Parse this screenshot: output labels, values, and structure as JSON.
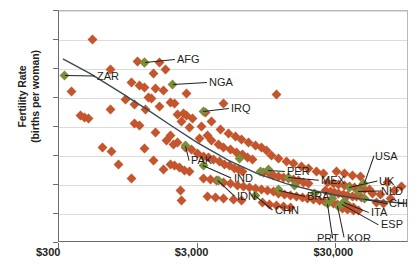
{
  "chart_data": {
    "type": "scatter",
    "title": "",
    "xlabel": "",
    "ylabel": "Fertility Rate (births per woman)",
    "ylabel_line1": "Fertility Rate",
    "ylabel_line2": "(births per woman)",
    "x_scale": "log",
    "xlim": [
      300,
      100000
    ],
    "ylim": [
      0,
      8
    ],
    "yticks": [
      0,
      1,
      2,
      3,
      4,
      5,
      6,
      7,
      8
    ],
    "ytick_labels": [
      "0",
      "1",
      "2",
      "3",
      "4",
      "5",
      "6",
      "7",
      "8"
    ],
    "xticks": [
      300,
      3000,
      30000
    ],
    "xtick_labels": [
      "$300",
      "$3,000",
      "$30,000"
    ],
    "grid": "horizontal",
    "legend": "none",
    "marker_color_primary": "#c4552c",
    "marker_color_highlight": "#7b8f3a",
    "trendline_color": "#3b4a52",
    "annotations": [
      {
        "code": "ZAR",
        "x": 330,
        "y": 5.78
      },
      {
        "code": "AFG",
        "x": 1250,
        "y": 6.24
      },
      {
        "code": "NGA",
        "x": 1980,
        "y": 5.48
      },
      {
        "code": "IRQ",
        "x": 3300,
        "y": 4.55
      },
      {
        "code": "PAK",
        "x": 2450,
        "y": 3.35
      },
      {
        "code": "IND",
        "x": 3300,
        "y": 2.68
      },
      {
        "code": "IDN",
        "x": 4200,
        "y": 2.17
      },
      {
        "code": "CHN",
        "x": 7800,
        "y": 1.64
      },
      {
        "code": "PER",
        "x": 9700,
        "y": 2.52
      },
      {
        "code": "MEX",
        "x": 13500,
        "y": 2.27
      },
      {
        "code": "BRA",
        "x": 11500,
        "y": 1.83
      },
      {
        "code": "PRT",
        "x": 26000,
        "y": 1.36
      },
      {
        "code": "KOR",
        "x": 31000,
        "y": 1.26
      },
      {
        "code": "ITA",
        "x": 34000,
        "y": 1.42
      },
      {
        "code": "ESP",
        "x": 33000,
        "y": 1.36
      },
      {
        "code": "CHE",
        "x": 48000,
        "y": 1.52
      },
      {
        "code": "NLD",
        "x": 43000,
        "y": 1.78
      },
      {
        "code": "UK",
        "x": 37000,
        "y": 1.92
      },
      {
        "code": "USA",
        "x": 47000,
        "y": 2.06
      }
    ],
    "points_orange": [
      [
        520,
        7.03
      ],
      [
        370,
        5.22
      ],
      [
        700,
        5.97
      ],
      [
        1100,
        6.27
      ],
      [
        1250,
        6.24
      ],
      [
        1600,
        6.22
      ],
      [
        1450,
        5.83
      ],
      [
        1750,
        5.97
      ],
      [
        1000,
        5.55
      ],
      [
        1500,
        5.33
      ],
      [
        1700,
        5.25
      ],
      [
        2500,
        5.17
      ],
      [
        430,
        4.38
      ],
      [
        460,
        4.33
      ],
      [
        490,
        4.29
      ],
      [
        700,
        4.6
      ],
      [
        900,
        4.94
      ],
      [
        1050,
        4.78
      ],
      [
        1150,
        5.44
      ],
      [
        1230,
        5.35
      ],
      [
        1330,
        5.01
      ],
      [
        1400,
        4.98
      ],
      [
        1260,
        4.6
      ],
      [
        1580,
        4.72
      ],
      [
        1900,
        4.85
      ],
      [
        2050,
        4.8
      ],
      [
        2150,
        4.44
      ],
      [
        2380,
        4.48
      ],
      [
        2500,
        4.4
      ],
      [
        2300,
        4.2
      ],
      [
        1050,
        4.12
      ],
      [
        1150,
        4.06
      ],
      [
        1500,
        3.8
      ],
      [
        1900,
        3.72
      ],
      [
        2600,
        3.98
      ],
      [
        2750,
        4.28
      ],
      [
        3400,
        4.5
      ],
      [
        4600,
        4.8
      ],
      [
        11000,
        5.12
      ],
      [
        620,
        3.28
      ],
      [
        720,
        3.16
      ],
      [
        1250,
        3.25
      ],
      [
        800,
        2.7
      ],
      [
        1000,
        2.22
      ],
      [
        1450,
        2.86
      ],
      [
        1700,
        2.55
      ],
      [
        1900,
        2.72
      ],
      [
        2050,
        2.66
      ],
      [
        2200,
        2.62
      ],
      [
        2400,
        2.5
      ],
      [
        2600,
        2.46
      ],
      [
        2250,
        1.82
      ],
      [
        2300,
        1.48
      ],
      [
        1800,
        3.55
      ],
      [
        2000,
        3.4
      ],
      [
        2150,
        3.45
      ],
      [
        2450,
        3.3
      ],
      [
        2700,
        3.22
      ],
      [
        3000,
        3.1
      ],
      [
        3300,
        3.0
      ],
      [
        3600,
        2.95
      ],
      [
        3900,
        2.88
      ],
      [
        4300,
        2.8
      ],
      [
        4700,
        2.72
      ],
      [
        5100,
        2.66
      ],
      [
        5500,
        2.58
      ],
      [
        5900,
        2.52
      ],
      [
        6300,
        2.46
      ],
      [
        3100,
        3.62
      ],
      [
        3500,
        3.7
      ],
      [
        3800,
        3.52
      ],
      [
        4200,
        3.4
      ],
      [
        4600,
        3.3
      ],
      [
        5200,
        3.22
      ],
      [
        5700,
        3.12
      ],
      [
        6300,
        3.05
      ],
      [
        6900,
        2.95
      ],
      [
        7500,
        2.88
      ],
      [
        3300,
        2.22
      ],
      [
        3700,
        2.18
      ],
      [
        4100,
        2.14
      ],
      [
        4600,
        2.1
      ],
      [
        5200,
        2.05
      ],
      [
        5800,
        2.0
      ],
      [
        6400,
        1.96
      ],
      [
        7100,
        1.92
      ],
      [
        7800,
        1.88
      ],
      [
        8600,
        1.84
      ],
      [
        3500,
        1.62
      ],
      [
        4000,
        1.58
      ],
      [
        4600,
        1.54
      ],
      [
        5400,
        1.5
      ],
      [
        6200,
        1.46
      ],
      [
        3200,
        4.02
      ],
      [
        3800,
        4.2
      ],
      [
        4400,
        3.92
      ],
      [
        5000,
        3.78
      ],
      [
        5600,
        3.68
      ],
      [
        6200,
        3.56
      ],
      [
        7000,
        3.45
      ],
      [
        7800,
        3.36
      ],
      [
        8600,
        3.28
      ],
      [
        9400,
        3.18
      ],
      [
        9000,
        2.42
      ],
      [
        9800,
        2.38
      ],
      [
        10600,
        2.34
      ],
      [
        11400,
        2.3
      ],
      [
        12400,
        2.26
      ],
      [
        13500,
        2.22
      ],
      [
        14700,
        2.18
      ],
      [
        16000,
        2.14
      ],
      [
        17400,
        2.1
      ],
      [
        19000,
        2.06
      ],
      [
        9500,
        1.8
      ],
      [
        10500,
        1.76
      ],
      [
        11500,
        1.72
      ],
      [
        12700,
        1.68
      ],
      [
        14000,
        1.64
      ],
      [
        15500,
        1.6
      ],
      [
        17000,
        1.57
      ],
      [
        18700,
        1.54
      ],
      [
        20500,
        1.5
      ],
      [
        22500,
        1.47
      ],
      [
        8800,
        1.38
      ],
      [
        9800,
        1.34
      ],
      [
        11000,
        1.3
      ],
      [
        12500,
        1.27
      ],
      [
        14000,
        1.24
      ],
      [
        10200,
        3.02
      ],
      [
        11500,
        2.92
      ],
      [
        13000,
        2.82
      ],
      [
        14800,
        2.74
      ],
      [
        16800,
        2.64
      ],
      [
        19000,
        2.56
      ],
      [
        21500,
        2.48
      ],
      [
        24000,
        2.4
      ],
      [
        24500,
        1.44
      ],
      [
        26500,
        1.4
      ],
      [
        28500,
        1.36
      ],
      [
        30500,
        1.33
      ],
      [
        32500,
        1.3
      ],
      [
        35000,
        1.28
      ],
      [
        37500,
        1.26
      ],
      [
        40000,
        1.24
      ],
      [
        25000,
        1.8
      ],
      [
        27000,
        1.76
      ],
      [
        29000,
        1.73
      ],
      [
        31000,
        1.7
      ],
      [
        33500,
        1.68
      ],
      [
        36000,
        1.65
      ],
      [
        39000,
        1.62
      ],
      [
        42000,
        1.6
      ],
      [
        45500,
        1.58
      ],
      [
        26000,
        2.1
      ],
      [
        28500,
        2.06
      ],
      [
        31000,
        2.02
      ],
      [
        34000,
        1.98
      ],
      [
        37000,
        1.95
      ],
      [
        40500,
        1.92
      ],
      [
        44000,
        1.89
      ],
      [
        48000,
        1.86
      ],
      [
        52000,
        1.84
      ],
      [
        30000,
        2.46
      ],
      [
        34000,
        2.4
      ],
      [
        39000,
        2.34
      ],
      [
        45000,
        2.28
      ],
      [
        33000,
        1.18
      ],
      [
        36000,
        1.15
      ],
      [
        39500,
        1.13
      ],
      [
        43500,
        1.12
      ],
      [
        55000,
        1.7
      ],
      [
        62000,
        1.66
      ],
      [
        70000,
        2.08
      ],
      [
        78000,
        1.8
      ],
      [
        88000,
        1.96
      ],
      [
        58000,
        1.4
      ],
      [
        66000,
        1.36
      ],
      [
        74000,
        1.52
      ]
    ],
    "points_green": [
      [
        330,
        5.78
      ],
      [
        1250,
        6.24
      ],
      [
        1980,
        5.48
      ],
      [
        3300,
        4.55
      ],
      [
        2450,
        3.35
      ],
      [
        3300,
        2.68
      ],
      [
        4200,
        2.17
      ],
      [
        7800,
        1.64
      ],
      [
        9700,
        2.52
      ],
      [
        13500,
        2.27
      ],
      [
        11500,
        1.83
      ],
      [
        26000,
        1.36
      ],
      [
        31000,
        1.26
      ],
      [
        34000,
        1.42
      ],
      [
        33000,
        1.36
      ],
      [
        48000,
        1.52
      ],
      [
        43000,
        1.78
      ],
      [
        37000,
        1.92
      ],
      [
        47000,
        2.06
      ],
      [
        6000,
        2.9
      ],
      [
        8500,
        2.45
      ],
      [
        15000,
        2.0
      ],
      [
        21000,
        1.7
      ],
      [
        28000,
        1.55
      ]
    ]
  }
}
